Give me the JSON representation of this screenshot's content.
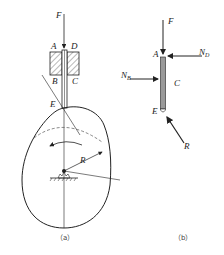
{
  "figure_a": {
    "caption": "（a）",
    "labels": {
      "force": "F",
      "A": "A",
      "D": "D",
      "B": "B",
      "C": "C",
      "E": "E",
      "radius": "R"
    }
  },
  "figure_b": {
    "caption": "（b）",
    "labels": {
      "force": "F",
      "A": "A",
      "C": "C",
      "E": "E",
      "N_B": "N",
      "N_B_sub": "B",
      "N_D": "N",
      "N_D_sub": "D",
      "reaction": "R"
    }
  },
  "colors": {
    "line": "#222222",
    "dashed": "#555555",
    "rod_fill": "#9a9a9a"
  }
}
